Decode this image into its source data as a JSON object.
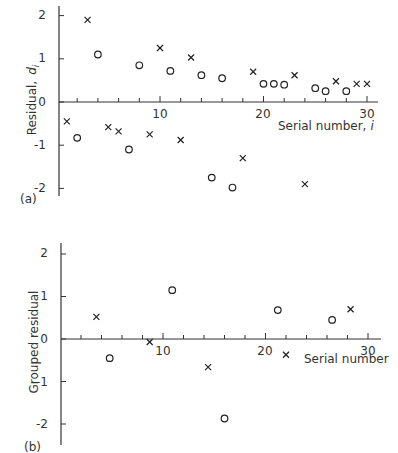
{
  "chart_data": [
    {
      "type": "scatter",
      "panel_label": "(a)",
      "title": "",
      "xlabel": "Serial number, i",
      "ylabel": "Residual, d_i",
      "xlim": [
        0,
        31
      ],
      "ylim": [
        -2.2,
        2.3
      ],
      "x_ticks": [
        10,
        20,
        30
      ],
      "x_minor_ticks": [
        2,
        4,
        6,
        8,
        12,
        14,
        16,
        18,
        22,
        24,
        26,
        28
      ],
      "y_ticks": [
        2,
        1,
        0,
        -1,
        -2
      ],
      "grid": false,
      "legend": null,
      "series": [
        {
          "name": "cross",
          "marker": "x",
          "points": [
            [
              1,
              -0.45
            ],
            [
              3,
              1.9
            ],
            [
              5,
              -0.58
            ],
            [
              6,
              -0.68
            ],
            [
              9,
              -0.75
            ],
            [
              10,
              1.25
            ],
            [
              12,
              -0.88
            ],
            [
              13,
              1.03
            ],
            [
              18,
              -1.3
            ],
            [
              19,
              0.7
            ],
            [
              23,
              0.62
            ],
            [
              24,
              -1.9
            ],
            [
              27,
              0.48
            ],
            [
              29,
              0.42
            ],
            [
              30,
              0.42
            ]
          ]
        },
        {
          "name": "circle",
          "marker": "o",
          "points": [
            [
              2,
              -0.83
            ],
            [
              4,
              1.1
            ],
            [
              7,
              -1.1
            ],
            [
              8,
              0.85
            ],
            [
              11,
              0.72
            ],
            [
              14,
              0.62
            ],
            [
              15,
              -1.75
            ],
            [
              16,
              0.55
            ],
            [
              17,
              -1.98
            ],
            [
              20,
              0.42
            ],
            [
              21,
              0.42
            ],
            [
              22,
              0.4
            ],
            [
              25,
              0.32
            ],
            [
              26,
              0.25
            ],
            [
              28,
              0.25
            ]
          ]
        }
      ]
    },
    {
      "type": "scatter",
      "panel_label": "(b)",
      "title": "",
      "xlabel": "Serial number",
      "ylabel": "Grouped residual",
      "xlim": [
        0,
        31
      ],
      "ylim": [
        -2.5,
        2.3
      ],
      "x_ticks": [
        10,
        20,
        30
      ],
      "x_minor_ticks": [
        2,
        4,
        6,
        8,
        12,
        14,
        16,
        18,
        22,
        24,
        26,
        28
      ],
      "y_ticks": [
        2,
        1,
        0,
        -1,
        -2
      ],
      "grid": false,
      "legend": null,
      "series": [
        {
          "name": "cross",
          "marker": "x",
          "points": [
            [
              3.5,
              0.52
            ],
            [
              8.7,
              -0.07
            ],
            [
              14.4,
              -0.66
            ],
            [
              22,
              -0.37
            ],
            [
              28.3,
              0.7
            ]
          ]
        },
        {
          "name": "circle",
          "marker": "o",
          "points": [
            [
              4.8,
              -0.45
            ],
            [
              10.9,
              1.15
            ],
            [
              16,
              -1.87
            ],
            [
              21.2,
              0.68
            ],
            [
              26.5,
              0.45
            ]
          ]
        }
      ]
    }
  ],
  "labels": {
    "a": {
      "panel": "(a)",
      "ylabel_main": "Residual,",
      "ylabel_var": "d",
      "ylabel_sub": "i",
      "xlabel_main": "Serial number,",
      "xlabel_var": "i",
      "yticks": [
        "2",
        "1",
        "0",
        "-1",
        "-2"
      ],
      "xticks": [
        "10",
        "20",
        "30"
      ]
    },
    "b": {
      "panel": "(b)",
      "ylabel": "Grouped residual",
      "xlabel": "Serial number",
      "yticks": [
        "2",
        "1",
        "0",
        "-1",
        "-2"
      ],
      "xticks": [
        "10",
        "20",
        "30"
      ]
    }
  }
}
